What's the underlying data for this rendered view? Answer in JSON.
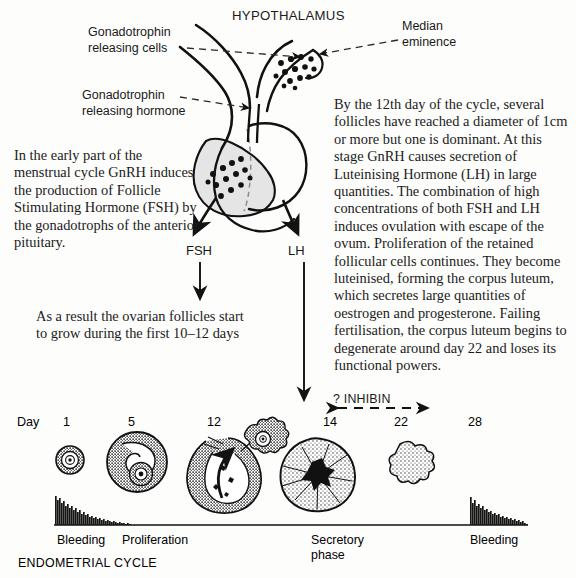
{
  "figure": {
    "title": "HYPOTHALAMUS",
    "type": "annotated biological diagram: hypothalamic-pituitary-ovarian axis and endometrial cycle"
  },
  "anatomy_labels": {
    "hypothalamus": "HYPOTHALAMUS",
    "gonadotrophin_releasing_cells": "Gonadotrophin\nreleasing cells",
    "gonadotrophin_releasing_cells_line1": "Gonadotrophin",
    "gonadotrophin_releasing_cells_line2": "releasing cells",
    "median_eminence_line1": "Median",
    "median_eminence_line2": "eminence",
    "gonadotrophin_releasing_hormone_line1": "Gonadotrophin",
    "gonadotrophin_releasing_hormone_line2": "releasing hormone"
  },
  "hormone_arrows": {
    "fsh": "FSH",
    "lh": "LH",
    "inhibin": "? INHIBIN"
  },
  "paragraphs": {
    "left": "In the early part of the menstrual cycle GnRH induces the production of Follicle Stimulating Hormone (FSH) by the gonadotrophs of the anterior pituitary.",
    "result": "As a result the ovarian follicles start to grow during the first 10–12 days",
    "right": "By the 12th day of the cycle, several follicles have reached a diameter of 1cm or more but one is dominant. At this stage GnRH causes secretion of Luteinising Hormone (LH) in large quantities. The combination of high concentrations of both FSH and LH induces ovulation with escape of the ovum. Proliferation of the retained follicular cells continues. They become luteinised, forming the corpus luteum, which secretes large quantities of oestrogen and progesterone. Failing fertilisation, the corpus luteum begins to degenerate around day 22 and loses its functional powers."
  },
  "timeline": {
    "axis_label": "Day",
    "days": [
      "1",
      "5",
      "12",
      "14",
      "22",
      "28"
    ],
    "cycle_caption": "ENDOMETRIAL CYCLE",
    "phases": [
      {
        "label": "Bleeding"
      },
      {
        "label": "Proliferation"
      },
      {
        "label": "Secretory phase",
        "line1": "Secretory",
        "line2": "phase"
      },
      {
        "label": "Bleeding"
      }
    ],
    "stages": [
      {
        "day": "1",
        "name": "primordial-follicle"
      },
      {
        "day": "5",
        "name": "antral-follicle"
      },
      {
        "day": "12",
        "name": "ovulating-follicle-with-released-ovum"
      },
      {
        "day": "14",
        "name": "corpus-luteum"
      },
      {
        "day": "22",
        "name": "corpus-albicans"
      }
    ]
  },
  "colors": {
    "ink": "#111111",
    "paper": "#fdfdfc",
    "pituitary_fill": "#e3e3e3",
    "stipple": "#2b2b2b"
  }
}
